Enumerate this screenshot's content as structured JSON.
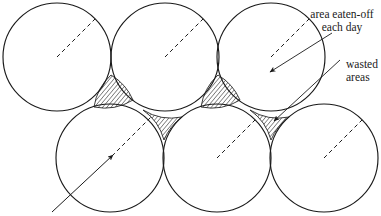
{
  "figure": {
    "background_color": "#ffffff",
    "stroke_color": "#1a1a1a",
    "hatch_color": "#1a1a1a",
    "width": 381,
    "height": 216
  },
  "annotations": [
    {
      "id": "area-eaten-off",
      "line1": "area eaten-off",
      "line2": "each day",
      "text_x": 342,
      "text_y": 18,
      "leader": {
        "x1": 330,
        "y1": 30,
        "x2": 268,
        "y2": 70
      },
      "arrow_at": {
        "x": 268,
        "y": 70
      }
    },
    {
      "id": "wasted-areas",
      "line1": "wasted",
      "line2": "areas",
      "text_x": 346,
      "text_y": 68,
      "leader": {
        "x1": 338,
        "y1": 62,
        "x2": 272,
        "y2": 122
      },
      "arrow_at": {
        "x": 272,
        "y": 122
      }
    }
  ],
  "circles": [
    {
      "id": "top-left",
      "cx": 57,
      "cy": 57,
      "r": 54,
      "row": "top",
      "index": 0
    },
    {
      "id": "top-middle",
      "cx": 165,
      "cy": 57,
      "r": 54,
      "row": "top",
      "index": 1
    },
    {
      "id": "top-right",
      "cx": 271,
      "cy": 57,
      "r": 54,
      "row": "top",
      "index": 2
    },
    {
      "id": "bottom-left",
      "cx": 110,
      "cy": 158,
      "r": 54,
      "row": "bottom",
      "index": 0
    },
    {
      "id": "bottom-middle",
      "cx": 217,
      "cy": 158,
      "r": 54,
      "row": "bottom",
      "index": 1
    },
    {
      "id": "bottom-right",
      "cx": 324,
      "cy": 158,
      "r": 54,
      "row": "bottom",
      "index": 2
    }
  ],
  "radius_markers": [
    {
      "circle": "top-left",
      "x1": 57,
      "y1": 57,
      "x2": 95,
      "y2": 19,
      "style": "dashed",
      "arrow": false
    },
    {
      "circle": "top-middle",
      "x1": 165,
      "y1": 57,
      "x2": 203,
      "y2": 19,
      "style": "dashed",
      "arrow": false
    },
    {
      "circle": "top-right",
      "x1": 271,
      "y1": 57,
      "x2": 309,
      "y2": 19,
      "style": "dashed",
      "arrow": false
    },
    {
      "circle": "bottom-middle",
      "x1": 217,
      "y1": 158,
      "x2": 255,
      "y2": 120,
      "style": "dashed",
      "arrow": false
    },
    {
      "circle": "bottom-right",
      "x1": 324,
      "y1": 158,
      "x2": 362,
      "y2": 120,
      "style": "dashed",
      "arrow": false
    }
  ],
  "long_diagonal": {
    "id": "long-diagonal-line",
    "solid_from": {
      "x": 52,
      "y": 212
    },
    "solid_to": {
      "x": 110,
      "y": 158
    },
    "dashed_from": {
      "x": 110,
      "y": 158
    },
    "dashed_to": {
      "x": 152,
      "y": 116
    },
    "arrow_at": {
      "x": 110,
      "y": 158
    }
  },
  "wasted_areas": [
    {
      "id": "gap-1",
      "orientation": "up",
      "cx": 112,
      "cy": 92,
      "label": "wasted area"
    },
    {
      "id": "gap-2",
      "orientation": "down",
      "cx": 163,
      "cy": 123,
      "label": "wasted area"
    },
    {
      "id": "gap-3",
      "orientation": "up",
      "cx": 218,
      "cy": 92,
      "label": "wasted area"
    },
    {
      "id": "gap-4",
      "orientation": "down",
      "cx": 270,
      "cy": 123,
      "label": "wasted area"
    }
  ]
}
